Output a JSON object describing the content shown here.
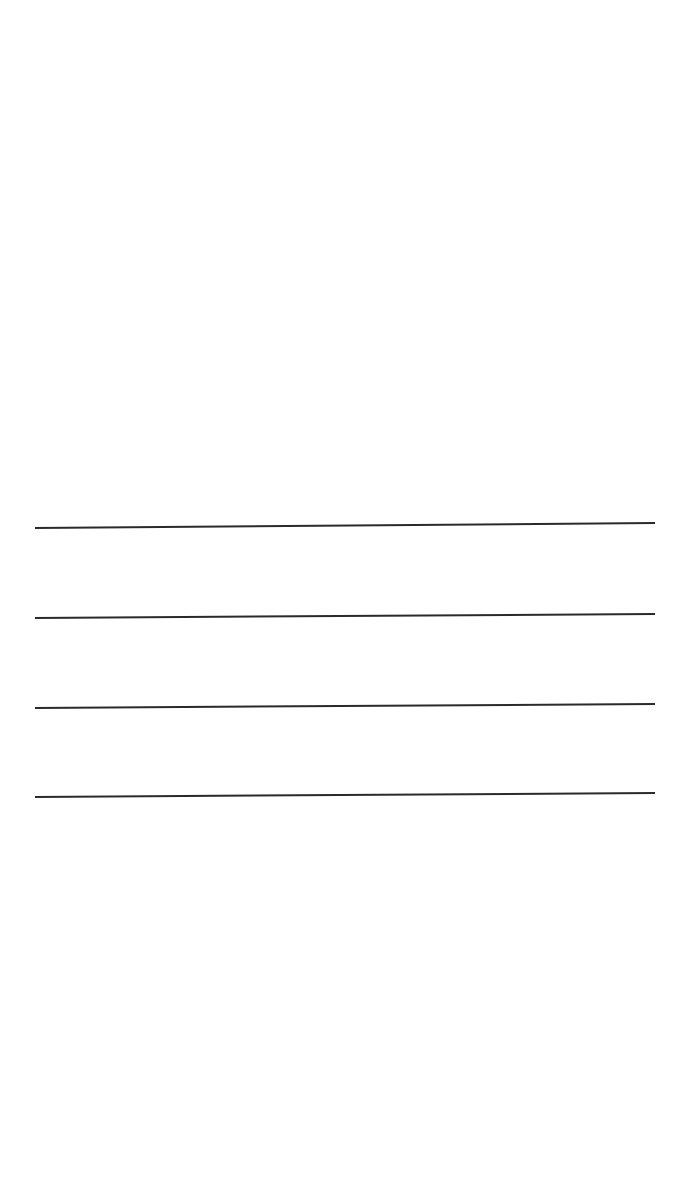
{
  "page": {
    "background": "#ffffff",
    "width": 690,
    "height": 1180
  },
  "ruled_lines": {
    "color": "#2a2a2a",
    "stroke_width": 2,
    "lines": [
      {
        "x1": 35,
        "y1": 528,
        "x2": 655,
        "y2": 523
      },
      {
        "x1": 35,
        "y1": 618,
        "x2": 655,
        "y2": 614
      },
      {
        "x1": 35,
        "y1": 708,
        "x2": 655,
        "y2": 704
      },
      {
        "x1": 35,
        "y1": 797,
        "x2": 655,
        "y2": 793
      }
    ]
  }
}
